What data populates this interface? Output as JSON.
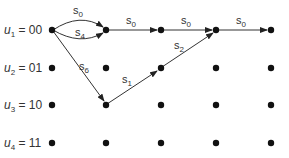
{
  "diagram": {
    "type": "trellis",
    "states": [
      {
        "var": "u",
        "sub": "1",
        "value": "00"
      },
      {
        "var": "u",
        "sub": "2",
        "value": "01"
      },
      {
        "var": "u",
        "sub": "3",
        "value": "10"
      },
      {
        "var": "u",
        "sub": "4",
        "value": "11"
      }
    ],
    "columns": 5,
    "edges": [
      {
        "from": [
          0,
          0
        ],
        "to": [
          1,
          0
        ],
        "label": "s",
        "sub": "0",
        "curve": "up"
      },
      {
        "from": [
          0,
          0
        ],
        "to": [
          1,
          0
        ],
        "label": "s",
        "sub": "4",
        "curve": "down"
      },
      {
        "from": [
          0,
          0
        ],
        "to": [
          1,
          2
        ],
        "label": "s",
        "sub": "6"
      },
      {
        "from": [
          1,
          0
        ],
        "to": [
          2,
          0
        ],
        "label": "s",
        "sub": "0"
      },
      {
        "from": [
          1,
          2
        ],
        "to": [
          2,
          1
        ],
        "label": "s",
        "sub": "1"
      },
      {
        "from": [
          2,
          0
        ],
        "to": [
          3,
          0
        ],
        "label": "s",
        "sub": "0"
      },
      {
        "from": [
          2,
          1
        ],
        "to": [
          3,
          0
        ],
        "label": "s",
        "sub": "2"
      },
      {
        "from": [
          3,
          0
        ],
        "to": [
          4,
          0
        ],
        "label": "s",
        "sub": "0"
      }
    ]
  }
}
